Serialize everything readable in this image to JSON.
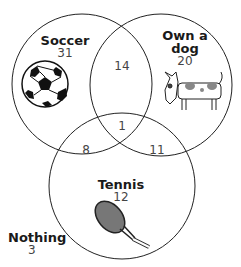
{
  "sets": [
    {
      "name": "Soccer",
      "only_count": "31",
      "icon": "soccer-ball-icon"
    },
    {
      "name": "Own a dog",
      "line1": "Own a",
      "line2": "dog",
      "only_count": "20",
      "icon": "dog-icon"
    },
    {
      "name": "Tennis",
      "only_count": "12",
      "icon": "tennis-racket-icon"
    }
  ],
  "intersections": {
    "soccer_dog": "14",
    "soccer_tennis": "8",
    "dog_tennis": "11",
    "all_three": "1"
  },
  "outside": {
    "label": "Nothing",
    "count": "3"
  },
  "colors": {
    "stroke": "#222222",
    "text": "#1a1a1a",
    "numbers": "#444444"
  }
}
